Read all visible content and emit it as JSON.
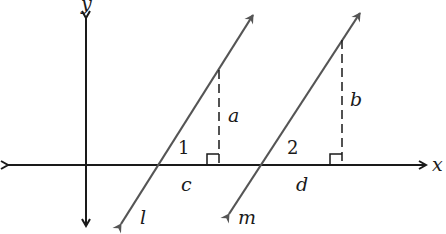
{
  "diagram": {
    "type": "coordinate-geometry",
    "axes": {
      "x_label": "x",
      "y_label": "y"
    },
    "lines": [
      {
        "name": "l",
        "label": "l"
      },
      {
        "name": "m",
        "label": "m"
      }
    ],
    "segments": {
      "a": "a",
      "b": "b",
      "c": "c",
      "d": "d"
    },
    "angles": {
      "angle1": "1",
      "angle2": "2"
    },
    "colors": {
      "axis": "#1a1a1a",
      "line": "#555555",
      "background": "#ffffff"
    }
  }
}
